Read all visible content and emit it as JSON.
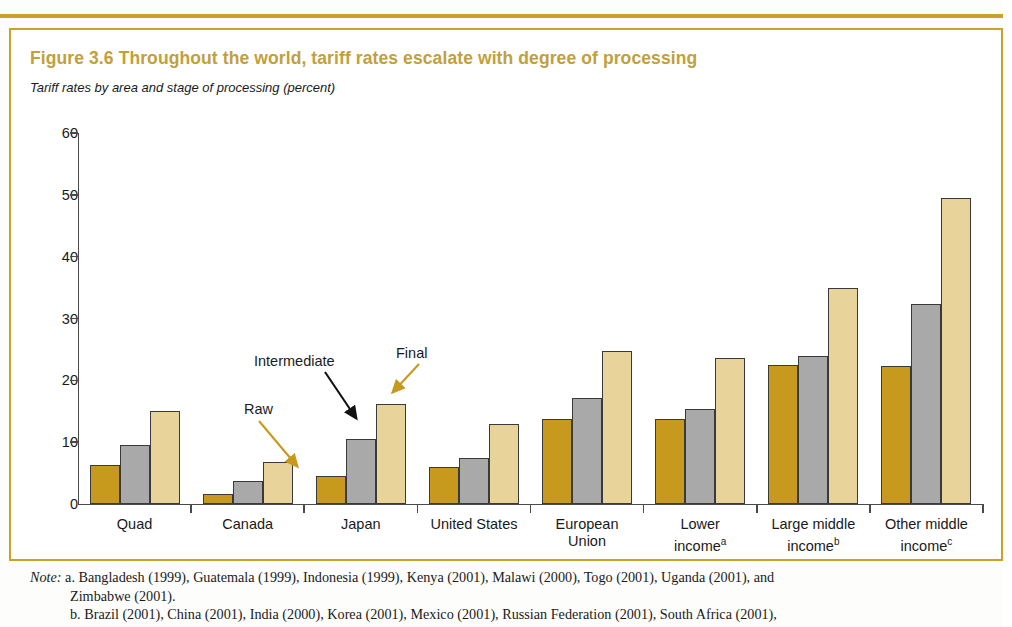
{
  "figure": {
    "title": "Figure 3.6  Throughout the world, tariff rates escalate with degree of processing",
    "subtitle": "Tariff rates by area and stage of processing (percent)",
    "title_color": "#c2a03a",
    "frame_color": "#c9a227"
  },
  "annotations": {
    "raw": "Raw",
    "intermediate": "Intermediate",
    "final": "Final"
  },
  "axis": {
    "y_ticks": [
      "0",
      "10",
      "20",
      "30",
      "40",
      "50",
      "60"
    ]
  },
  "note": {
    "label": "Note:",
    "line_a": "a. Bangladesh (1999), Guatemala (1999), Indonesia (1999), Kenya (2001), Malawi (2000), Togo (2001), Uganda (2001), and",
    "line_a_cont": "Zimbabwe (2001).",
    "line_b": "b. Brazil (2001), China (2001), India (2000), Korea (2001), Mexico (2001), Russian Federation (2001), South Africa (2001),"
  },
  "chart_data": {
    "type": "bar",
    "title": "Figure 3.6  Throughout the world, tariff rates escalate with degree of processing",
    "subtitle": "Tariff rates by area and stage of processing (percent)",
    "xlabel": "",
    "ylabel": "percent",
    "ylim": [
      0,
      60
    ],
    "yticks": [
      0,
      10,
      20,
      30,
      40,
      50,
      60
    ],
    "grid": false,
    "legend": "inline-annotations",
    "categories": [
      "Quad",
      "Canada",
      "Japan",
      "United States",
      "European Union",
      "Lower incomeᵃ",
      "Large middle incomeᵇ",
      "Other middle incomeᶜ"
    ],
    "category_labels": [
      {
        "line1": "Quad",
        "line2": "",
        "sup": ""
      },
      {
        "line1": "Canada",
        "line2": "",
        "sup": ""
      },
      {
        "line1": "Japan",
        "line2": "",
        "sup": ""
      },
      {
        "line1": "United States",
        "line2": "",
        "sup": ""
      },
      {
        "line1": "European",
        "line2": "Union",
        "sup": ""
      },
      {
        "line1": "Lower",
        "line2": "income",
        "sup": "a"
      },
      {
        "line1": "Large middle",
        "line2": "income",
        "sup": "b"
      },
      {
        "line1": "Other middle",
        "line2": "income",
        "sup": "c"
      }
    ],
    "series": [
      {
        "name": "Raw",
        "color": "#c79a1e",
        "values": [
          6.3,
          1.7,
          4.6,
          6.0,
          13.7,
          13.8,
          22.5,
          22.3
        ]
      },
      {
        "name": "Intermediate",
        "color": "#a9a9a9",
        "values": [
          9.5,
          3.8,
          10.5,
          7.5,
          17.2,
          15.4,
          24.0,
          32.3
        ]
      },
      {
        "name": "Final",
        "color": "#e8d49a",
        "values": [
          15.0,
          6.8,
          16.2,
          13.0,
          24.8,
          23.6,
          35.0,
          49.5
        ]
      }
    ]
  }
}
